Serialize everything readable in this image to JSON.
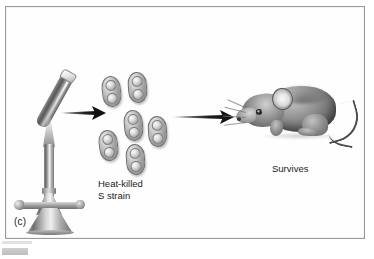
{
  "figure": {
    "panel_label": "(c)",
    "background_color": "#ffffff",
    "frame_color": "#9a9a9a"
  },
  "stages": {
    "heat_treatment": {
      "equipment_name": "bunsen-burner-with-test-tube",
      "flame_color": "#969696"
    },
    "bacteria": {
      "label_line_1": "Heat-killed",
      "label_line_2": "S strain",
      "cell_count": 6,
      "cell_shape": "diplococcus",
      "cell_color": "#9e9e9e"
    },
    "outcome": {
      "subject": "mouse",
      "label": "Survives",
      "text_color": "#1c1c1c"
    }
  },
  "arrows": {
    "arrow_1_name": "arrow-burner-to-bacteria",
    "arrow_2_name": "arrow-bacteria-to-mouse",
    "color": "#121212"
  }
}
